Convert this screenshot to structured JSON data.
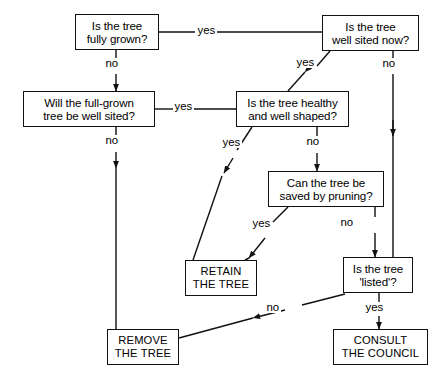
{
  "diagram": {
    "stroke_color": "#111111",
    "background_color": "#ffffff",
    "nodes": [
      {
        "id": "fully-grown",
        "type": "question",
        "lines": [
          "Is the tree",
          "fully grown?"
        ],
        "x": 75,
        "y": 14,
        "w": 84,
        "h": 36
      },
      {
        "id": "well-sited-now",
        "type": "question",
        "lines": [
          "Is the tree",
          "well sited now?"
        ],
        "x": 322,
        "y": 15,
        "w": 97,
        "h": 36
      },
      {
        "id": "full-grown-well-sited",
        "type": "question",
        "lines": [
          "Will the full-grown",
          "tree be well sited?"
        ],
        "x": 23,
        "y": 91,
        "w": 132,
        "h": 36
      },
      {
        "id": "healthy-well-shaped",
        "type": "question",
        "lines": [
          "Is the tree healthy",
          "and well shaped?"
        ],
        "x": 236,
        "y": 91,
        "w": 113,
        "h": 36
      },
      {
        "id": "saved-by-pruning",
        "type": "question",
        "lines": [
          "Can the tree be",
          "saved by pruning?"
        ],
        "x": 268,
        "y": 171,
        "w": 116,
        "h": 36
      },
      {
        "id": "retain-the-tree",
        "type": "terminal",
        "lines": [
          "RETAIN",
          "THE TREE"
        ],
        "x": 185,
        "y": 260,
        "w": 72,
        "h": 36
      },
      {
        "id": "is-listed",
        "type": "question",
        "lines": [
          "Is the tree",
          "'listed'?"
        ],
        "x": 343,
        "y": 257,
        "w": 70,
        "h": 36
      },
      {
        "id": "remove-the-tree",
        "type": "terminal",
        "lines": [
          "REMOVE",
          "THE TREE"
        ],
        "x": 107,
        "y": 329,
        "w": 72,
        "h": 36
      },
      {
        "id": "consult-the-council",
        "type": "terminal",
        "lines": [
          "CONSULT",
          "THE COUNCIL"
        ],
        "x": 333,
        "y": 329,
        "w": 95,
        "h": 36
      }
    ],
    "edges": [
      {
        "id": "e-grown-yes",
        "from": "fully-grown",
        "to": "well-sited-now",
        "label": "yes",
        "label_x": 203,
        "label_y": 25
      },
      {
        "id": "e-grown-no",
        "from": "fully-grown",
        "to": "full-grown-well-sited",
        "label": "no",
        "label_x": 110,
        "label_y": 61
      },
      {
        "id": "e-sited-yes",
        "from": "well-sited-now",
        "to": "healthy-well-shaped",
        "label": "yes",
        "label_x": 302,
        "label_y": 60
      },
      {
        "id": "e-sited-no",
        "from": "well-sited-now",
        "to": "is-listed",
        "label": "no",
        "label_x": 386,
        "label_y": 61
      },
      {
        "id": "e-fgws-yes",
        "from": "full-grown-well-sited",
        "to": "healthy-well-shaped",
        "label": "yes",
        "label_x": 183,
        "label_y": 102
      },
      {
        "id": "e-fgws-no",
        "from": "full-grown-well-sited",
        "to": "remove-the-tree",
        "label": "no",
        "label_x": 110,
        "label_y": 139
      },
      {
        "id": "e-healthy-yes",
        "from": "healthy-well-shaped",
        "to": "retain-the-tree",
        "label": "yes",
        "label_x": 228,
        "label_y": 143
      },
      {
        "id": "e-healthy-no",
        "from": "healthy-well-shaped",
        "to": "saved-by-pruning",
        "label": "no",
        "label_x": 311,
        "label_y": 142
      },
      {
        "id": "e-prune-yes",
        "from": "saved-by-pruning",
        "to": "retain-the-tree",
        "label": "yes",
        "label_x": 258,
        "label_y": 226
      },
      {
        "id": "e-prune-no",
        "from": "saved-by-pruning",
        "to": "is-listed",
        "label": "no",
        "label_x": 345,
        "label_y": 224
      },
      {
        "id": "e-listed-yes",
        "from": "is-listed",
        "to": "consult-the-council",
        "label": "yes",
        "label_x": 371,
        "label_y": 308
      },
      {
        "id": "e-listed-no",
        "from": "is-listed",
        "to": "remove-the-tree",
        "label": "no",
        "label_x": 272,
        "label_y": 308
      }
    ]
  }
}
